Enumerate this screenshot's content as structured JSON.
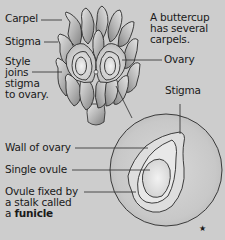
{
  "diagram": {
    "labels": {
      "carpel": "Carpel",
      "stigma_top": "Stigma",
      "style_line1": "Style",
      "style_line2": "joins",
      "style_line3": "stigma",
      "style_line4": "to ovary.",
      "note_line1": "A buttercup",
      "note_line2": "has several",
      "note_line3": "carpels.",
      "ovary": "Ovary",
      "stigma_detail": "Stigma",
      "wall_of_ovary": "Wall of ovary",
      "single_ovule": "Single ovule",
      "funicle_line1": "Ovule fixed by",
      "funicle_line2": "a stalk called",
      "funicle_line3_prefix": "a ",
      "funicle_line3_bold": "funicle"
    },
    "marker": "★",
    "colors": {
      "background": "#cdcdcd",
      "outline": "#2a2a2a",
      "petal_light": "#e2e2e2",
      "petal_dark": "#8e8e8e",
      "circle_fill": "#c4c4c4"
    }
  }
}
